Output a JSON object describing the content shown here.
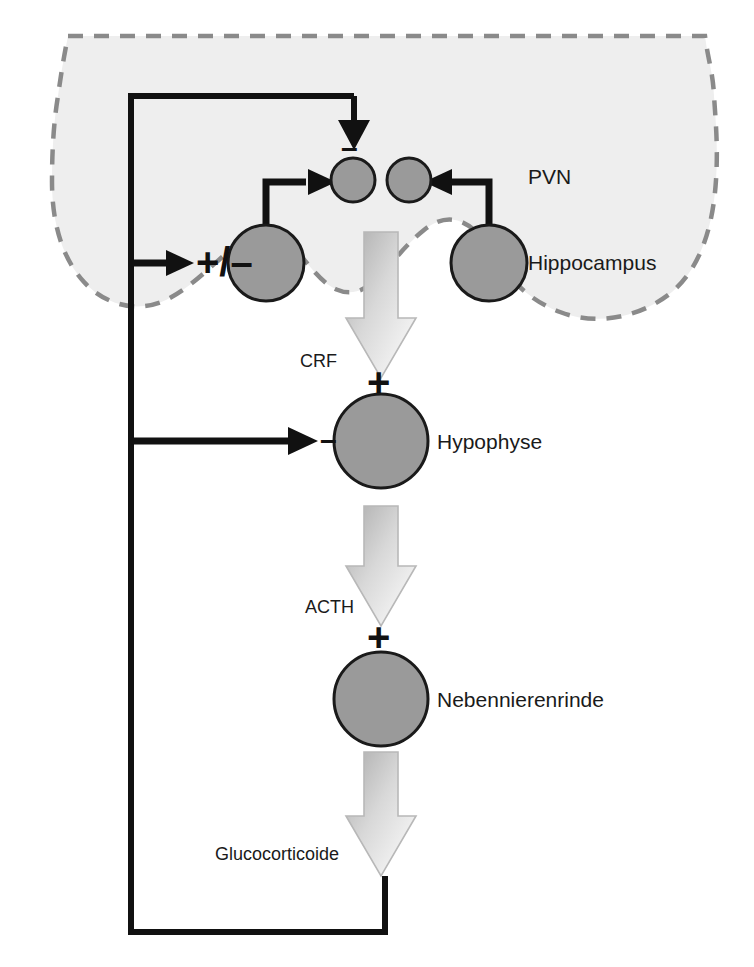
{
  "diagram": {
    "colors": {
      "brain_fill": "#eeeeee",
      "brain_outline": "#808080",
      "cell_fill": "#9a9a9a",
      "cell_stroke": "#1a1a1a",
      "line": "#111111",
      "gradient_arrow_dark": "#b4b4b4",
      "gradient_arrow_light": "#ffffff",
      "text": "#1a1a1a"
    },
    "regions": [
      {
        "id": "pvn",
        "label": "PVN"
      },
      {
        "id": "hippocampus",
        "label": "Hippocampus"
      },
      {
        "id": "hypophyse",
        "label": "Hypophyse"
      },
      {
        "id": "nebennierenrinde",
        "label": "Nebennierenrinde"
      }
    ],
    "hormones": [
      {
        "id": "crf",
        "label": "CRF"
      },
      {
        "id": "acth",
        "label": "ACTH"
      },
      {
        "id": "glucocorticoide",
        "label": "Glucocorticoide"
      }
    ],
    "signs": [
      {
        "id": "pvn-inhibition",
        "label": "–"
      },
      {
        "id": "hippocampus-modulation",
        "label": "+/–"
      },
      {
        "id": "crf-stimulation",
        "label": "+"
      },
      {
        "id": "hypophyse-inhibition",
        "label": "–"
      },
      {
        "id": "acth-stimulation",
        "label": "+"
      }
    ]
  }
}
